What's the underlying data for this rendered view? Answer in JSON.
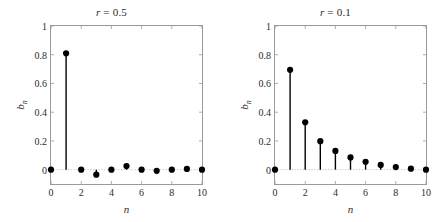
{
  "figure": {
    "background": "#ffffff",
    "width": 447,
    "height": 222,
    "axis_color": "#9a9a9a",
    "marker_color": "#000000",
    "stem_color": "#000000",
    "baseline_color": "#b8b8b8"
  },
  "panels": [
    {
      "id": "panel-left",
      "title_var": "r",
      "title_eq": " = ",
      "title_value": "0.5",
      "title": "r = 0.5"
    },
    {
      "id": "panel-right",
      "title_var": "r",
      "title_eq": " = ",
      "title_value": "0.1",
      "title": "r = 0.1"
    }
  ],
  "chart_data": [
    {
      "type": "line",
      "plot_style": "stem",
      "title": "r = 0.5",
      "xlabel": "n",
      "ylabel": "b_n",
      "x": [
        0,
        1,
        2,
        3,
        4,
        5,
        6,
        7,
        8,
        9,
        10
      ],
      "values": [
        0,
        0.81,
        0,
        -0.035,
        0,
        0.025,
        0,
        -0.008,
        0,
        0.005,
        0
      ],
      "xlim": [
        0,
        10
      ],
      "ylim": [
        -0.1,
        1
      ],
      "xticks": [
        0,
        2,
        4,
        6,
        8,
        10
      ],
      "xticklabels": [
        "0",
        "2",
        "4",
        "6",
        "8",
        "10"
      ],
      "yticks": [
        0,
        0.2,
        0.4,
        0.6,
        0.8,
        1
      ],
      "yticklabels": [
        "0",
        "0.2",
        "0.4",
        "0.6",
        "0.8",
        "1"
      ],
      "grid": false,
      "legend": null,
      "baseline": 0,
      "marker": "filled-circle"
    },
    {
      "type": "line",
      "plot_style": "stem",
      "title": "r = 0.1",
      "xlabel": "n",
      "ylabel": "b_n",
      "x": [
        0,
        1,
        2,
        3,
        4,
        5,
        6,
        7,
        8,
        9,
        10
      ],
      "values": [
        0,
        0.695,
        0.33,
        0.198,
        0.13,
        0.085,
        0.055,
        0.033,
        0.018,
        0.007,
        0
      ],
      "xlim": [
        0,
        10
      ],
      "ylim": [
        -0.1,
        1
      ],
      "xticks": [
        0,
        2,
        4,
        6,
        8,
        10
      ],
      "xticklabels": [
        "0",
        "2",
        "4",
        "6",
        "8",
        "10"
      ],
      "yticks": [
        0,
        0.2,
        0.4,
        0.6,
        0.8,
        1
      ],
      "yticklabels": [
        "0",
        "0.2",
        "0.4",
        "0.6",
        "0.8",
        "1"
      ],
      "grid": false,
      "legend": null,
      "baseline": 0,
      "marker": "filled-circle"
    }
  ],
  "axis_labels": {
    "x": "n",
    "y_base": "b",
    "y_sub": "n"
  }
}
